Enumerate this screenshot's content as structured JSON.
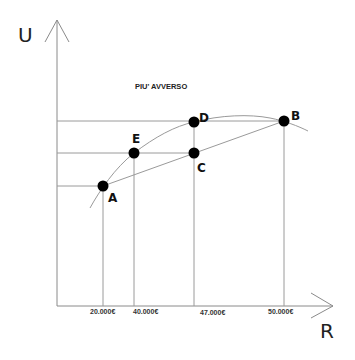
{
  "diagram": {
    "title": "PIU' AVVERSO",
    "y_axis_label": "U",
    "x_axis_label": "R",
    "x_ticks": [
      {
        "label": "20.000€",
        "x": 103
      },
      {
        "label": "40.000€",
        "x": 134
      },
      {
        "label": "47.000€",
        "x": 194
      },
      {
        "label": "50.000€",
        "x": 284
      }
    ],
    "points": [
      {
        "label": "A",
        "x": 103,
        "y": 186
      },
      {
        "label": "B",
        "x": 284,
        "y": 121
      },
      {
        "label": "C",
        "x": 194,
        "y": 153
      },
      {
        "label": "D",
        "x": 194,
        "y": 122
      },
      {
        "label": "E",
        "x": 134,
        "y": 153
      }
    ],
    "colors": {
      "lines": "#9a9a9a",
      "points": "#000000",
      "text": "#222222"
    }
  }
}
